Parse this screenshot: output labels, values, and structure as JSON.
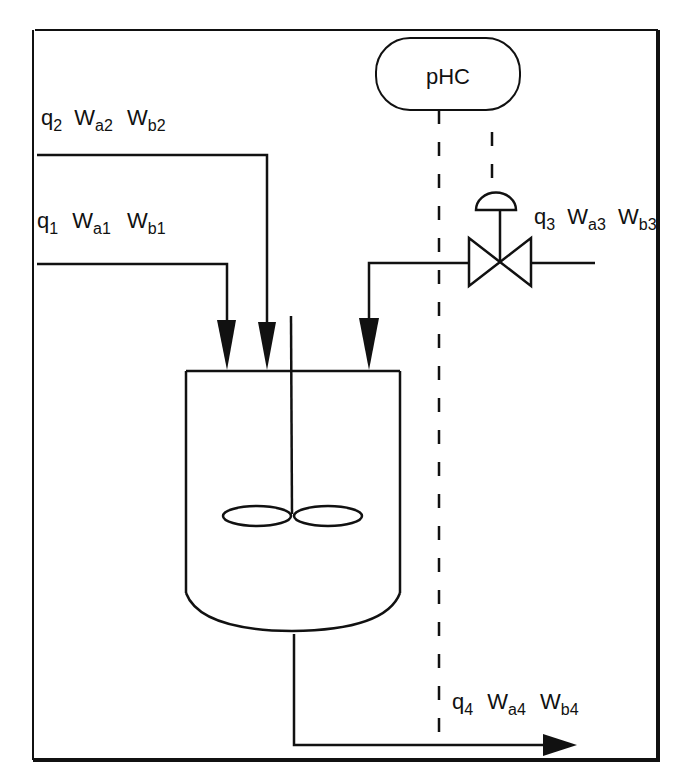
{
  "diagram": {
    "type": "process-control-schematic",
    "controller": {
      "label": "pHC"
    },
    "streams": [
      {
        "id": "stream-2",
        "q": "q",
        "q_sub": "2",
        "wa": "W",
        "wa_sub": "a2",
        "wb": "W",
        "wb_sub": "b2"
      },
      {
        "id": "stream-1",
        "q": "q",
        "q_sub": "1",
        "wa": "W",
        "wa_sub": "a1",
        "wb": "W",
        "wb_sub": "b1"
      },
      {
        "id": "stream-3",
        "q": "q",
        "q_sub": "3",
        "wa": "W",
        "wa_sub": "a3",
        "wb": "W",
        "wb_sub": "b3"
      },
      {
        "id": "stream-4",
        "q": "q",
        "q_sub": "4",
        "wa": "W",
        "wa_sub": "a4",
        "wb": "W",
        "wb_sub": "b4"
      }
    ],
    "colors": {
      "line": "#111111",
      "background": "#ffffff"
    }
  }
}
